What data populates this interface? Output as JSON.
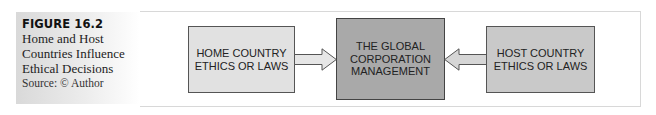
{
  "caption": {
    "figure_label": "FIGURE 16.2",
    "title_lines": [
      "Home and Host",
      "Countries Influence",
      "Ethical Decisions"
    ],
    "source": "Source: © Author"
  },
  "diagram": {
    "nodes": {
      "home": {
        "lines": [
          "HOME COUNTRY",
          "ETHICS OR LAWS"
        ],
        "fill": "#e1e1e1"
      },
      "center": {
        "lines": [
          "THE GLOBAL",
          "CORPORATION",
          "MANAGEMENT"
        ],
        "fill": "#a9a9a9"
      },
      "host": {
        "lines": [
          "HOST COUNTRY",
          "ETHICS OR LAWS"
        ],
        "fill": "#c9c9c9"
      }
    },
    "edges": [
      {
        "from": "home",
        "to": "center",
        "icon": "arrow-right-icon"
      },
      {
        "from": "host",
        "to": "center",
        "icon": "arrow-left-icon"
      }
    ]
  }
}
